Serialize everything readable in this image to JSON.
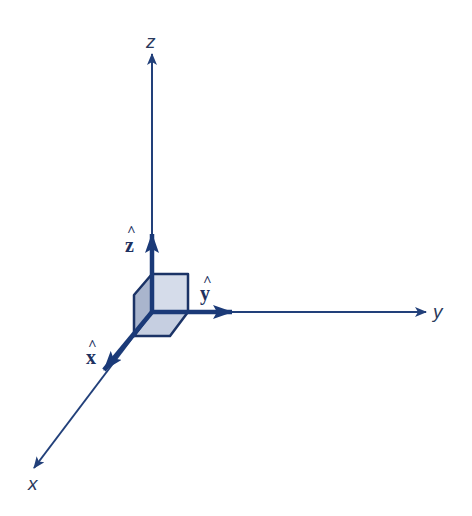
{
  "diagram": {
    "colors": {
      "axis_line": "#22407a",
      "unit_vector": "#1b3a78",
      "cube_outline": "#1b3366",
      "cube_front": "#d5dcea",
      "cube_left": "#a9b5cd",
      "cube_bottom": "#c6cfe1",
      "label": "#2a3a5c"
    },
    "axes": [
      {
        "name": "z",
        "label": "z"
      },
      {
        "name": "y",
        "label": "y"
      },
      {
        "name": "x",
        "label": "x"
      }
    ],
    "unit_vectors": [
      {
        "name": "z-hat",
        "letter": "z",
        "hat": "^"
      },
      {
        "name": "y-hat",
        "letter": "y",
        "hat": "^"
      },
      {
        "name": "x-hat",
        "letter": "x",
        "hat": "^"
      }
    ]
  }
}
